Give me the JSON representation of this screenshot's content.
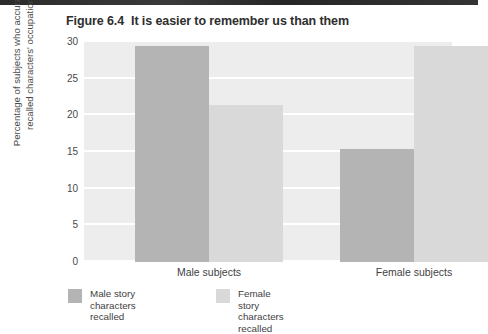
{
  "figure": {
    "number_label": "Figure 6.4",
    "title": "It is easier to remember us than them"
  },
  "colors": {
    "plot_background": "#ededed",
    "gridline": "#ffffff",
    "page_background": "#ffffff",
    "series_male": "#b4b4b4",
    "series_female": "#d9d9d9",
    "text": "#3f3f3f",
    "title_text": "#2e2e2e"
  },
  "axes": {
    "y_title_line1": "Percentage of subjects who accurately",
    "y_title_line2": "recalled characters' occupation",
    "y_ticks": [
      "30",
      "25",
      "20",
      "15",
      "10",
      "5",
      "0"
    ]
  },
  "chart_data": {
    "type": "bar",
    "xlabel": "",
    "ylabel": "Percentage of subjects who accurately recalled characters' occupation",
    "categories": [
      "Male subjects",
      "Female subjects"
    ],
    "series": [
      {
        "name": "Male story characters recalled",
        "legend_line1": "Male story",
        "legend_line2": "characters recalled",
        "color": "#b4b4b4",
        "values": [
          29.4,
          15.4
        ]
      },
      {
        "name": "Female story characters recalled",
        "legend_line1": "Female story",
        "legend_line2": "characters recalled",
        "color": "#d9d9d9",
        "values": [
          21.4,
          29.5
        ]
      }
    ],
    "ylim": [
      0,
      30
    ],
    "ytick_values": [
      0,
      5,
      10,
      15,
      20,
      25,
      30
    ],
    "grid": true,
    "grid_axis": "y",
    "legend_position": "bottom-left"
  }
}
